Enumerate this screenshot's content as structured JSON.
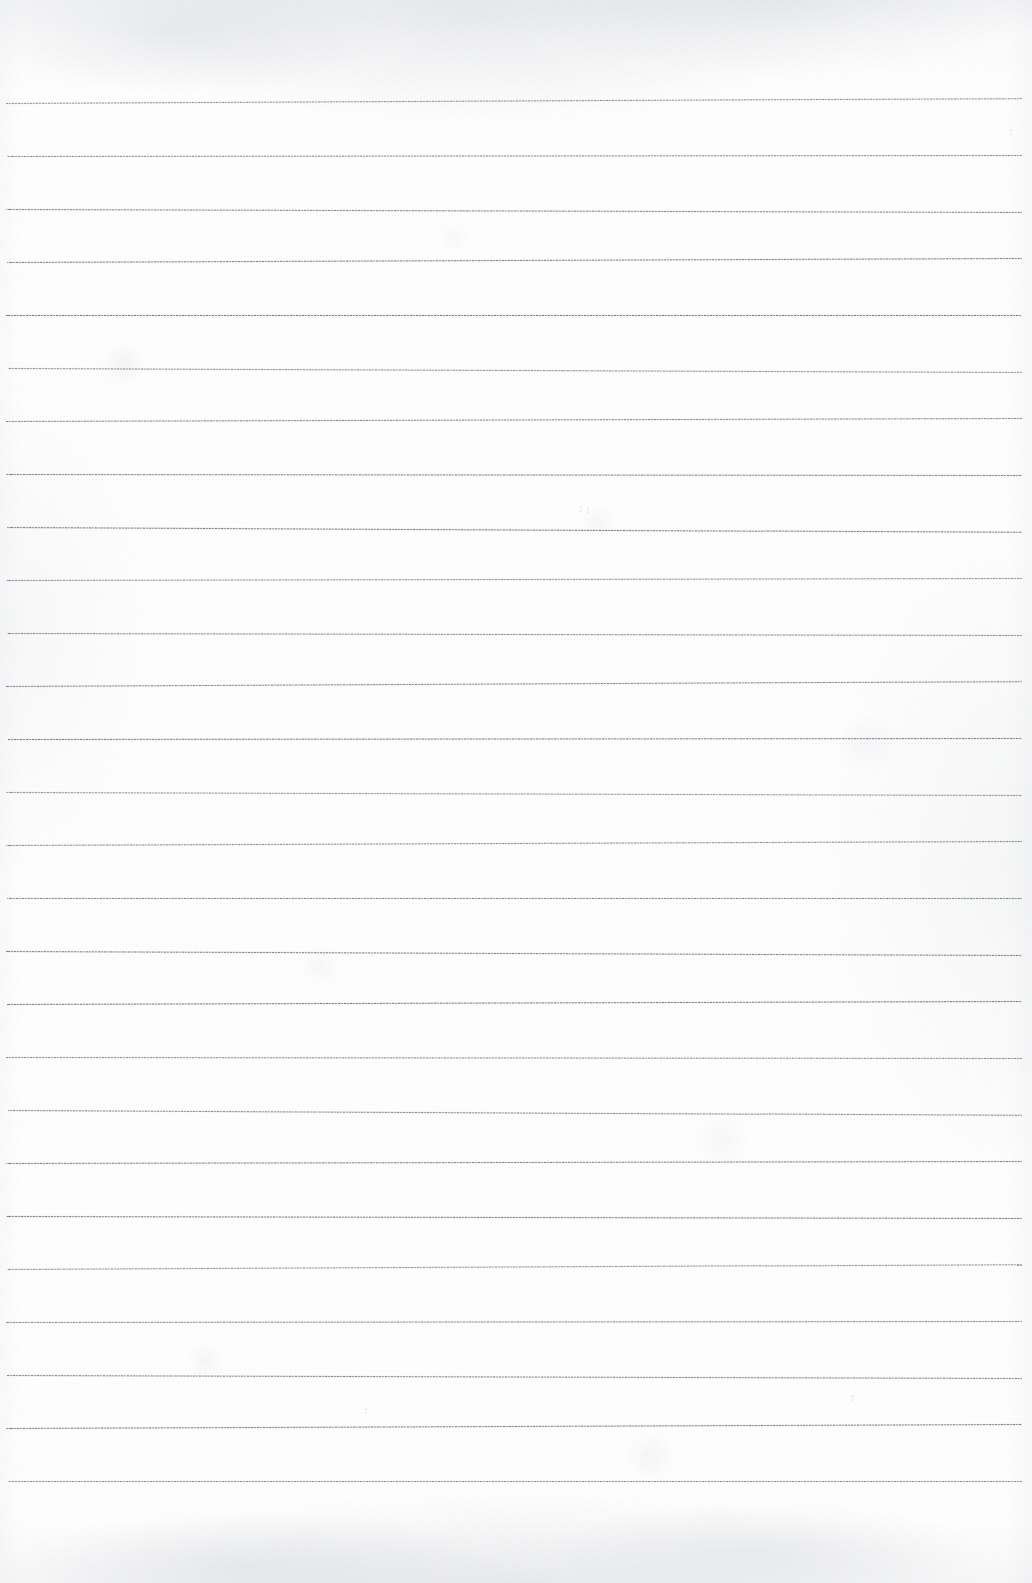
{
  "document": {
    "kind": "scanned-ruled-notebook-page",
    "page_width": 1032,
    "page_height": 1583,
    "background_color": "#fdfdfd",
    "written_content": "",
    "visible_text": "",
    "heading": "",
    "page_number": ""
  },
  "ruling": {
    "line_color": "#6c707a",
    "line_count": 26,
    "first_line_y": 103,
    "line_spacing": 53.0,
    "line_left_x": 6,
    "line_right_x": 1022,
    "line_thickness": 1,
    "style": "single-ruled horizontal lines, no margin rule",
    "lines_y": [
      103,
      156,
      209,
      262,
      315,
      368,
      421,
      474,
      527,
      580,
      633,
      686,
      739,
      792,
      845,
      898,
      951,
      1004,
      1057,
      1110,
      1163,
      1216,
      1269,
      1322,
      1375,
      1428,
      1481
    ]
  },
  "margins": {
    "top_margin_height": 103,
    "bottom_margin_height": 102,
    "left_margin_width": 6,
    "right_margin_width": 10
  },
  "artifacts": {
    "top_edge_shading": "faint gray mottling along the top edge",
    "bottom_edge_shading": "faint gray mottling along the bottom edge",
    "specks": [
      {
        "x": 1009,
        "y": 129
      },
      {
        "x": 579,
        "y": 506
      },
      {
        "x": 586,
        "y": 507
      },
      {
        "x": 851,
        "y": 1395
      },
      {
        "x": 364,
        "y": 1408
      }
    ]
  }
}
